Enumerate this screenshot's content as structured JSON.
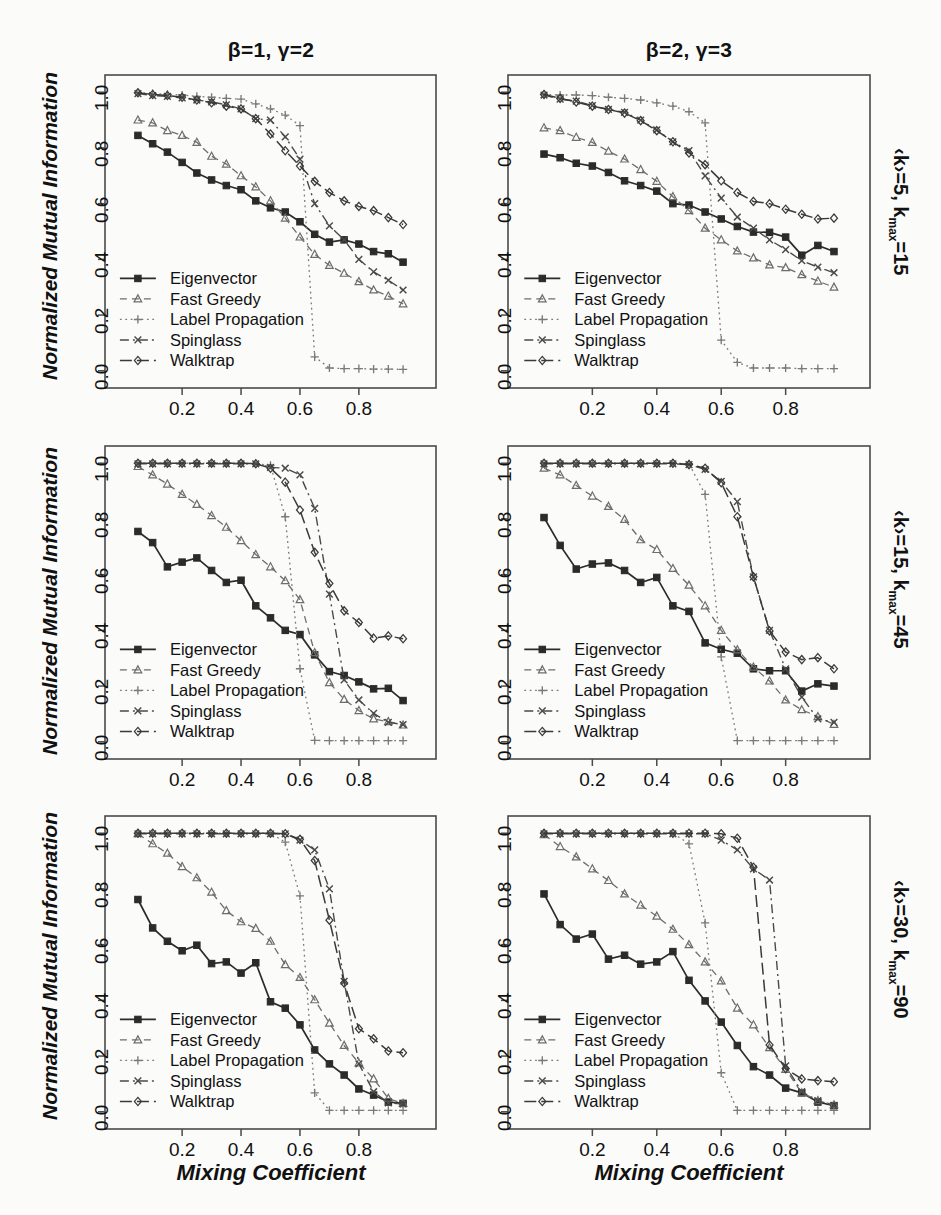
{
  "figure": {
    "ylabel": "Normalized Mutual Information",
    "xlabel": "Mixing Coefficient",
    "column_titles": [
      "β=1, γ=2",
      "β=2, γ=3"
    ],
    "row_labels": [
      {
        "prefix": "‹k›=5, k",
        "sub": "max",
        "suffix": "=15"
      },
      {
        "prefix": "‹k›=15, k",
        "sub": "max",
        "suffix": "=45"
      },
      {
        "prefix": "‹k›=30, k",
        "sub": "max",
        "suffix": "=90"
      }
    ],
    "xticks": [
      "0.2",
      "0.4",
      "0.6",
      "0.8"
    ],
    "xtick_values": [
      0.2,
      0.4,
      0.6,
      0.8
    ],
    "yticks": [
      "0.0",
      "0.2",
      "0.4",
      "0.6",
      "0.8",
      "1.0"
    ],
    "ytick_values": [
      0.0,
      0.2,
      0.4,
      0.6,
      0.8,
      1.0
    ],
    "xlim": [
      0.0,
      1.0
    ],
    "ylim": [
      -0.04,
      1.04
    ],
    "legend_labels": [
      "Eigenvector",
      "Fast Greedy",
      "Label Propagation",
      "Spinglass",
      "Walktrap"
    ],
    "legend_position": "bottom-left",
    "grid": false,
    "line_color": "#3a3a3a"
  },
  "series_style": [
    {
      "name": "Eigenvector",
      "marker": "square",
      "dash": "none",
      "width": 1.7,
      "color": "#2b2b2b"
    },
    {
      "name": "Fast Greedy",
      "marker": "triangle",
      "dash": "7,5",
      "width": 1.3,
      "color": "#6d6d6d"
    },
    {
      "name": "Label Propagation",
      "marker": "plus",
      "dash": "1.8,3.6",
      "width": 1.3,
      "color": "#7a7a7a"
    },
    {
      "name": "Spinglass",
      "marker": "cross",
      "dash": "9,4,2,4",
      "width": 1.4,
      "color": "#4a4a4a"
    },
    {
      "name": "Walktrap",
      "marker": "diamond",
      "dash": "12,5",
      "width": 1.5,
      "color": "#3a3a3a"
    }
  ],
  "chart_data": [
    {
      "type": "line",
      "panel": "r1c1",
      "title": "β=1, γ=2",
      "row_label": "‹k›=5, kmax=15",
      "xlabel": "Mixing Coefficient",
      "ylabel": "Normalized Mutual Information",
      "xlim": [
        0.0,
        1.0
      ],
      "ylim": [
        0.0,
        1.0
      ],
      "x": [
        0.05,
        0.1,
        0.15,
        0.2,
        0.25,
        0.3,
        0.35,
        0.4,
        0.45,
        0.5,
        0.55,
        0.6,
        0.65,
        0.7,
        0.75,
        0.8,
        0.85,
        0.9,
        0.95
      ],
      "series": [
        {
          "name": "Eigenvector",
          "values": [
            0.845,
            0.815,
            0.785,
            0.748,
            0.71,
            0.685,
            0.665,
            0.65,
            0.61,
            0.585,
            0.57,
            0.535,
            0.49,
            0.462,
            0.47,
            0.455,
            0.428,
            0.42,
            0.39
          ]
        },
        {
          "name": "Fast Greedy",
          "values": [
            0.9,
            0.89,
            0.862,
            0.845,
            0.82,
            0.77,
            0.742,
            0.7,
            0.66,
            0.61,
            0.548,
            0.48,
            0.418,
            0.378,
            0.35,
            0.32,
            0.29,
            0.268,
            0.24
          ]
        },
        {
          "name": "Label Propagation",
          "values": [
            0.998,
            0.995,
            0.992,
            0.99,
            0.985,
            0.982,
            0.978,
            0.975,
            0.958,
            0.94,
            0.918,
            0.88,
            0.05,
            0.01,
            0.008,
            0.008,
            0.006,
            0.006,
            0.005
          ]
        },
        {
          "name": "Spinglass",
          "values": [
            0.995,
            0.988,
            0.985,
            0.98,
            0.972,
            0.965,
            0.955,
            0.94,
            0.905,
            0.9,
            0.84,
            0.76,
            0.6,
            0.52,
            0.47,
            0.4,
            0.355,
            0.325,
            0.29
          ]
        },
        {
          "name": "Walktrap",
          "values": [
            0.998,
            0.992,
            0.988,
            0.982,
            0.972,
            0.962,
            0.95,
            0.94,
            0.905,
            0.85,
            0.79,
            0.735,
            0.68,
            0.64,
            0.61,
            0.59,
            0.575,
            0.55,
            0.525
          ]
        }
      ]
    },
    {
      "type": "line",
      "panel": "r1c2",
      "title": "β=2, γ=3",
      "row_label": "‹k›=5, kmax=15",
      "xlabel": "Mixing Coefficient",
      "ylabel": "Normalized Mutual Information",
      "xlim": [
        0.0,
        1.0
      ],
      "ylim": [
        0.0,
        1.0
      ],
      "x": [
        0.05,
        0.1,
        0.15,
        0.2,
        0.25,
        0.3,
        0.35,
        0.4,
        0.45,
        0.5,
        0.55,
        0.6,
        0.65,
        0.7,
        0.75,
        0.8,
        0.85,
        0.9,
        0.95
      ],
      "series": [
        {
          "name": "Eigenvector",
          "values": [
            0.778,
            0.765,
            0.745,
            0.735,
            0.712,
            0.682,
            0.665,
            0.645,
            0.6,
            0.595,
            0.57,
            0.545,
            0.518,
            0.498,
            0.497,
            0.48,
            0.415,
            0.45,
            0.428
          ]
        },
        {
          "name": "Fast Greedy",
          "values": [
            0.872,
            0.862,
            0.838,
            0.82,
            0.788,
            0.76,
            0.722,
            0.68,
            0.625,
            0.575,
            0.512,
            0.47,
            0.43,
            0.405,
            0.38,
            0.37,
            0.345,
            0.322,
            0.3
          ]
        },
        {
          "name": "Label Propagation",
          "values": [
            0.992,
            0.99,
            0.99,
            0.988,
            0.982,
            0.978,
            0.972,
            0.962,
            0.95,
            0.93,
            0.89,
            0.11,
            0.03,
            0.01,
            0.01,
            0.01,
            0.008,
            0.008,
            0.008
          ]
        },
        {
          "name": "Spinglass",
          "values": [
            0.99,
            0.975,
            0.968,
            0.952,
            0.938,
            0.928,
            0.9,
            0.865,
            0.822,
            0.79,
            0.7,
            0.62,
            0.552,
            0.512,
            0.47,
            0.435,
            0.395,
            0.372,
            0.352
          ]
        },
        {
          "name": "Walktrap",
          "values": [
            0.992,
            0.978,
            0.965,
            0.95,
            0.938,
            0.925,
            0.898,
            0.862,
            0.822,
            0.782,
            0.74,
            0.682,
            0.64,
            0.608,
            0.6,
            0.58,
            0.562,
            0.545,
            0.548
          ]
        }
      ]
    },
    {
      "type": "line",
      "panel": "r2c1",
      "title": "β=1, γ=2",
      "row_label": "‹k›=15, kmax=45",
      "xlabel": "Mixing Coefficient",
      "ylabel": "Normalized Mutual Information",
      "xlim": [
        0.0,
        1.0
      ],
      "ylim": [
        0.0,
        1.0
      ],
      "x": [
        0.05,
        0.1,
        0.15,
        0.2,
        0.25,
        0.3,
        0.35,
        0.4,
        0.45,
        0.5,
        0.55,
        0.6,
        0.65,
        0.7,
        0.75,
        0.8,
        0.85,
        0.9,
        0.95
      ],
      "series": [
        {
          "name": "Eigenvector",
          "values": [
            0.755,
            0.715,
            0.628,
            0.645,
            0.66,
            0.615,
            0.572,
            0.58,
            0.488,
            0.445,
            0.4,
            0.385,
            0.312,
            0.252,
            0.238,
            0.215,
            0.19,
            0.192,
            0.148
          ]
        },
        {
          "name": "Fast Greedy",
          "values": [
            0.988,
            0.958,
            0.925,
            0.888,
            0.852,
            0.812,
            0.77,
            0.722,
            0.672,
            0.628,
            0.578,
            0.51,
            0.32,
            0.212,
            0.152,
            0.112,
            0.082,
            0.072,
            0.06
          ]
        },
        {
          "name": "Label Propagation",
          "values": [
            1.0,
            1.0,
            1.0,
            1.0,
            1.0,
            1.0,
            1.0,
            1.0,
            0.998,
            0.992,
            0.808,
            0.262,
            0.005,
            0.004,
            0.004,
            0.004,
            0.004,
            0.004,
            0.004
          ]
        },
        {
          "name": "Spinglass",
          "values": [
            0.998,
            0.998,
            0.998,
            0.998,
            0.998,
            0.998,
            0.998,
            0.998,
            0.998,
            0.985,
            0.982,
            0.958,
            0.838,
            0.53,
            0.222,
            0.15,
            0.102,
            0.07,
            0.062
          ]
        },
        {
          "name": "Walktrap",
          "values": [
            1.0,
            1.0,
            1.0,
            1.0,
            1.0,
            1.0,
            1.0,
            1.0,
            0.998,
            0.982,
            0.932,
            0.832,
            0.68,
            0.568,
            0.47,
            0.428,
            0.372,
            0.38,
            0.37
          ]
        }
      ]
    },
    {
      "type": "line",
      "panel": "r2c2",
      "title": "β=2, γ=3",
      "row_label": "‹k›=15, kmax=45",
      "xlabel": "Mixing Coefficient",
      "ylabel": "Normalized Mutual Information",
      "xlim": [
        0.0,
        1.0
      ],
      "ylim": [
        0.0,
        1.0
      ],
      "x": [
        0.05,
        0.1,
        0.15,
        0.2,
        0.25,
        0.3,
        0.35,
        0.4,
        0.45,
        0.5,
        0.55,
        0.6,
        0.65,
        0.7,
        0.75,
        0.8,
        0.85,
        0.9,
        0.95
      ],
      "series": [
        {
          "name": "Eigenvector",
          "values": [
            0.805,
            0.705,
            0.62,
            0.638,
            0.642,
            0.615,
            0.572,
            0.59,
            0.488,
            0.468,
            0.355,
            0.332,
            0.318,
            0.262,
            0.255,
            0.255,
            0.182,
            0.208,
            0.2
          ]
        },
        {
          "name": "Fast Greedy",
          "values": [
            0.982,
            0.958,
            0.92,
            0.882,
            0.845,
            0.798,
            0.725,
            0.69,
            0.622,
            0.562,
            0.488,
            0.4,
            0.33,
            0.268,
            0.218,
            0.15,
            0.115,
            0.09,
            0.062
          ]
        },
        {
          "name": "Label Propagation",
          "values": [
            1.0,
            1.0,
            1.0,
            1.0,
            1.0,
            1.0,
            1.0,
            1.0,
            1.0,
            0.998,
            0.888,
            0.305,
            0.004,
            0.004,
            0.004,
            0.004,
            0.004,
            0.004,
            0.004
          ]
        },
        {
          "name": "Spinglass",
          "values": [
            0.998,
            0.998,
            0.998,
            0.998,
            0.998,
            0.998,
            0.998,
            0.998,
            0.998,
            0.995,
            0.978,
            0.935,
            0.862,
            0.592,
            0.4,
            0.262,
            0.16,
            0.082,
            0.07
          ]
        },
        {
          "name": "Walktrap",
          "values": [
            1.0,
            1.0,
            1.0,
            1.0,
            1.0,
            1.0,
            1.0,
            1.0,
            1.0,
            0.995,
            0.982,
            0.93,
            0.808,
            0.592,
            0.398,
            0.322,
            0.295,
            0.302,
            0.262
          ]
        }
      ]
    },
    {
      "type": "line",
      "panel": "r3c1",
      "title": "β=1, γ=2",
      "row_label": "‹k›=30, kmax=90",
      "xlabel": "Mixing Coefficient",
      "ylabel": "Normalized Mutual Information",
      "xlim": [
        0.0,
        1.0
      ],
      "ylim": [
        0.0,
        1.0
      ],
      "x": [
        0.05,
        0.1,
        0.15,
        0.2,
        0.25,
        0.3,
        0.35,
        0.4,
        0.45,
        0.5,
        0.55,
        0.6,
        0.65,
        0.7,
        0.75,
        0.8,
        0.85,
        0.9,
        0.95
      ],
      "series": [
        {
          "name": "Eigenvector",
          "values": [
            0.762,
            0.66,
            0.612,
            0.578,
            0.598,
            0.532,
            0.538,
            0.498,
            0.535,
            0.395,
            0.372,
            0.312,
            0.222,
            0.172,
            0.132,
            0.082,
            0.06,
            0.035,
            0.03
          ]
        },
        {
          "name": "Fast Greedy",
          "values": [
            0.998,
            0.962,
            0.928,
            0.88,
            0.84,
            0.788,
            0.722,
            0.682,
            0.658,
            0.612,
            0.528,
            0.482,
            0.402,
            0.318,
            0.238,
            0.175,
            0.118,
            0.048,
            0.03
          ]
        },
        {
          "name": "Label Propagation",
          "values": [
            1.0,
            1.0,
            1.0,
            1.0,
            1.0,
            1.0,
            1.0,
            1.0,
            1.0,
            1.0,
            0.968,
            0.775,
            0.068,
            0.005,
            0.005,
            0.005,
            0.005,
            0.005,
            0.005
          ]
        },
        {
          "name": "Spinglass",
          "values": [
            0.998,
            0.998,
            0.998,
            0.998,
            0.998,
            0.998,
            0.998,
            0.998,
            0.998,
            0.998,
            0.998,
            0.975,
            0.94,
            0.8,
            0.468,
            0.172,
            0.072,
            0.032,
            0.028
          ]
        },
        {
          "name": "Walktrap",
          "values": [
            1.0,
            1.0,
            1.0,
            1.0,
            1.0,
            1.0,
            1.0,
            1.0,
            1.0,
            1.0,
            0.998,
            0.978,
            0.902,
            0.688,
            0.462,
            0.298,
            0.262,
            0.218,
            0.212
          ]
        }
      ]
    },
    {
      "type": "line",
      "panel": "r3c2",
      "title": "β=2, γ=3",
      "row_label": "‹k›=30, kmax=90",
      "xlabel": "Mixing Coefficient",
      "ylabel": "Normalized Mutual Information",
      "xlim": [
        0.0,
        1.0
      ],
      "ylim": [
        0.0,
        1.0
      ],
      "x": [
        0.05,
        0.1,
        0.15,
        0.2,
        0.25,
        0.3,
        0.35,
        0.4,
        0.45,
        0.5,
        0.55,
        0.6,
        0.65,
        0.7,
        0.75,
        0.8,
        0.85,
        0.9,
        0.95
      ],
      "series": [
        {
          "name": "Eigenvector",
          "values": [
            0.782,
            0.672,
            0.62,
            0.638,
            0.548,
            0.562,
            0.53,
            0.538,
            0.575,
            0.472,
            0.398,
            0.322,
            0.238,
            0.162,
            0.132,
            0.085,
            0.068,
            0.035,
            0.022
          ]
        },
        {
          "name": "Fast Greedy",
          "values": [
            0.995,
            0.952,
            0.915,
            0.872,
            0.83,
            0.782,
            0.742,
            0.702,
            0.655,
            0.6,
            0.538,
            0.47,
            0.372,
            0.312,
            0.23,
            0.152,
            0.068,
            0.04,
            0.025
          ]
        },
        {
          "name": "Label Propagation",
          "values": [
            1.0,
            1.0,
            1.0,
            1.0,
            1.0,
            1.0,
            1.0,
            1.0,
            1.0,
            0.962,
            0.678,
            0.14,
            0.005,
            0.005,
            0.005,
            0.005,
            0.005,
            0.005,
            0.005
          ]
        },
        {
          "name": "Spinglass",
          "values": [
            0.998,
            0.998,
            0.998,
            0.998,
            0.998,
            0.998,
            0.998,
            0.998,
            0.998,
            0.998,
            0.998,
            0.975,
            0.94,
            0.872,
            0.832,
            0.165,
            0.072,
            0.04,
            0.022
          ]
        },
        {
          "name": "Walktrap",
          "values": [
            1.0,
            1.0,
            1.0,
            1.0,
            1.0,
            1.0,
            1.0,
            1.0,
            1.0,
            1.0,
            1.0,
            0.998,
            0.982,
            0.878,
            0.24,
            0.155,
            0.118,
            0.112,
            0.108
          ]
        }
      ]
    }
  ]
}
